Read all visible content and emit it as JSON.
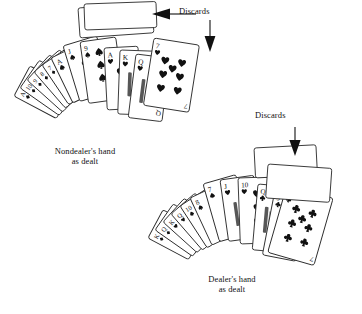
{
  "figure": {
    "background_color": "#ffffff",
    "ink_color": "#111111",
    "card_stroke_color": "#2b2b2b"
  },
  "annotations": [
    {
      "id": "discards-left",
      "label": "Discards",
      "arrow": "left-arrow",
      "points_to": "nondealer-discard-pile"
    },
    {
      "id": "discards-left-down",
      "label": "",
      "arrow": "down-arrow",
      "points_to": "nondealer-discard-pile"
    },
    {
      "id": "discards-right",
      "label": "Discards",
      "arrow": "down-arrow",
      "points_to": "dealer-discard-pile"
    }
  ],
  "captions": {
    "nondealer": {
      "line1": "Nondealer's hand",
      "line2": "as dealt"
    },
    "dealer": {
      "line1": "Dealer's hand",
      "line2": "as dealt"
    }
  },
  "hands": {
    "nondealer": {
      "name": "Nondealer's hand as dealt",
      "cards": [
        {
          "rank": "A",
          "suit": "diamond"
        },
        {
          "rank": "10",
          "suit": "diamond"
        },
        {
          "rank": "9",
          "suit": "diamond"
        },
        {
          "rank": "8",
          "suit": "diamond"
        },
        {
          "rank": "7",
          "suit": "diamond"
        },
        {
          "rank": "A",
          "suit": "spade"
        },
        {
          "rank": "J",
          "suit": "spade"
        },
        {
          "rank": "9",
          "suit": "spade"
        },
        {
          "rank": "A",
          "suit": "heart"
        },
        {
          "rank": "K",
          "suit": "heart"
        },
        {
          "rank": "Q",
          "suit": "heart"
        }
      ],
      "discards": [
        {
          "rank": "7",
          "suit": "heart",
          "pip_count": 7
        }
      ]
    },
    "dealer": {
      "name": "Dealer's hand as dealt",
      "cards": [
        {
          "rank": "K",
          "suit": "diamond"
        },
        {
          "rank": "Q",
          "suit": "diamond"
        },
        {
          "rank": "K",
          "suit": "heart"
        },
        {
          "rank": "Q",
          "suit": "heart"
        },
        {
          "rank": "10",
          "suit": "spade"
        },
        {
          "rank": "8",
          "suit": "spade"
        },
        {
          "rank": "7",
          "suit": "spade"
        },
        {
          "rank": "J",
          "suit": "heart"
        },
        {
          "rank": "10",
          "suit": "heart"
        },
        {
          "rank": "Q",
          "suit": "club"
        },
        {
          "rank": "9",
          "suit": "club"
        }
      ],
      "discards": [
        {
          "rank": "7",
          "suit": "club",
          "pip_count": 7
        }
      ]
    }
  }
}
